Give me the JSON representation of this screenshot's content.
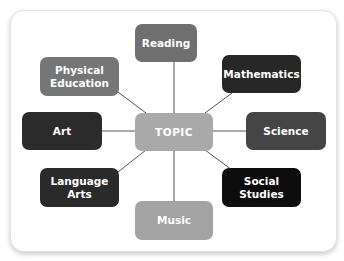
{
  "diagram": {
    "type": "concept-map",
    "center": {
      "label": "TOPIC",
      "color": "#a9a9a9"
    },
    "nodes": [
      {
        "id": "reading",
        "label": "Reading",
        "color": "#6f6f6f"
      },
      {
        "id": "physical-education",
        "label": "Physical Education",
        "color": "#767676"
      },
      {
        "id": "mathematics",
        "label": "Mathematics",
        "color": "#272727"
      },
      {
        "id": "art",
        "label": "Art",
        "color": "#2b2b2b"
      },
      {
        "id": "science",
        "label": "Science",
        "color": "#454545"
      },
      {
        "id": "language-arts",
        "label": "Language Arts",
        "color": "#2a2a2a"
      },
      {
        "id": "social-studies",
        "label": "Social Studies",
        "color": "#0d0d0d"
      },
      {
        "id": "music",
        "label": "Music",
        "color": "#a3a3a3"
      }
    ],
    "line_color": "#555555"
  }
}
